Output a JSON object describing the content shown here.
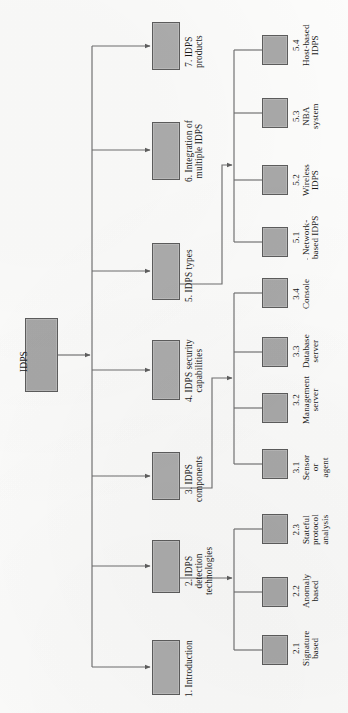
{
  "diagram": {
    "type": "hierarchical-tree",
    "orientation": "rotated-90-counterclockwise",
    "title": "IDPS",
    "colors": {
      "node_fill": "#acacac",
      "node_border": "#5d5d5d",
      "connector": "#6f6f6f",
      "text": "#1a1a1a",
      "background": "#fdfdfc"
    },
    "root": {
      "id": "root",
      "label": "IDPS"
    },
    "level1": [
      {
        "id": "n1",
        "number": "1.",
        "label": "1. Introduction",
        "lines": [
          "1. Introduction"
        ]
      },
      {
        "id": "n2",
        "number": "2.",
        "label": "2. IDPS detection technologies",
        "lines": [
          "2. IDPS",
          "detection",
          "technologies"
        ]
      },
      {
        "id": "n3",
        "number": "3.",
        "label": "3. IDPS components",
        "lines": [
          "3. IDPS",
          "components"
        ]
      },
      {
        "id": "n4",
        "number": "4.",
        "label": "4. IDPS security capabilities",
        "lines": [
          "4. IDPS security",
          "capabilities"
        ]
      },
      {
        "id": "n5",
        "number": "5.",
        "label": "5. IDPS types",
        "lines": [
          "5. IDPS types"
        ]
      },
      {
        "id": "n6",
        "number": "6.",
        "label": "6. Integration of multiple IDPS",
        "lines": [
          "6. Integration of",
          "multiple IDPS"
        ]
      },
      {
        "id": "n7",
        "number": "7.",
        "label": "7. IDPS products",
        "lines": [
          "7. IDPS",
          "products"
        ]
      }
    ],
    "level2": {
      "under_2": [
        {
          "id": "n21",
          "number": "2.1",
          "label": "Signature based",
          "lines": [
            "Signature",
            "based"
          ]
        },
        {
          "id": "n22",
          "number": "2.2",
          "label": "Anomaly based",
          "lines": [
            "Anomaly",
            "based"
          ]
        },
        {
          "id": "n23",
          "number": "2.3",
          "label": "Stateful protocol analysis",
          "lines": [
            "Stateful",
            "protocol",
            "analysis"
          ]
        }
      ],
      "under_3": [
        {
          "id": "n31",
          "number": "3.1",
          "label": "Sensor or agent",
          "lines": [
            "Sensor",
            "or",
            "agent"
          ]
        },
        {
          "id": "n32",
          "number": "3.2",
          "label": "Management server",
          "lines": [
            "Management",
            "server"
          ]
        },
        {
          "id": "n33",
          "number": "3.3",
          "label": "Database server",
          "lines": [
            "Database",
            "server"
          ]
        },
        {
          "id": "n34",
          "number": "3.4",
          "label": "Console",
          "lines": [
            "Console"
          ]
        }
      ],
      "under_5": [
        {
          "id": "n51",
          "number": "5.1",
          "label": "Network-based IDPS",
          "lines": [
            "Network-",
            "based IDPS"
          ]
        },
        {
          "id": "n52",
          "number": "5.2",
          "label": "Wireless IDPS",
          "lines": [
            "Wireless",
            "IDPS"
          ]
        },
        {
          "id": "n53",
          "number": "5.3",
          "label": "NBA system",
          "lines": [
            "NBA",
            "system"
          ]
        },
        {
          "id": "n54",
          "number": "5.4",
          "label": "Host-based IDPS",
          "lines": [
            "Host-based",
            "IDPS"
          ]
        }
      ]
    }
  }
}
